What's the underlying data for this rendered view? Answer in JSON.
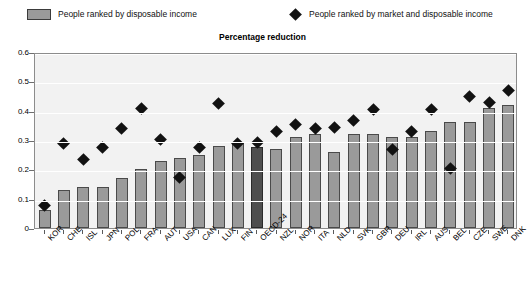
{
  "legend": {
    "items": [
      {
        "label": "People ranked by disposable income",
        "marker": "bar-swatch-icon",
        "color": "#9a9a9a"
      },
      {
        "label": "People ranked by market and disposable income",
        "marker": "diamond-icon",
        "color": "#121212"
      }
    ]
  },
  "title": "Percentage reduction",
  "chart_data": {
    "type": "bar",
    "title": "Percentage reduction",
    "xlabel": "",
    "ylabel": "",
    "ylim": [
      0,
      0.6
    ],
    "yticks": [
      "0",
      "0.1",
      "0.2",
      "0.3",
      "0.4",
      "0.5",
      "0.6"
    ],
    "ytick_values": [
      0,
      0.1,
      0.2,
      0.3,
      0.4,
      0.5,
      0.6
    ],
    "grid": true,
    "legend_position": "top",
    "highlight_category": "OECD-24",
    "highlight_color": "#4e4e4e",
    "bar_color": "#9a9a9a",
    "marker_color": "#121212",
    "categories": [
      "KOR",
      "CHE",
      "ISL",
      "JPN",
      "POL",
      "FRA",
      "AUT",
      "USA",
      "CAN",
      "LUX",
      "FIN",
      "OECD-24",
      "NZL",
      "NOR",
      "ITA",
      "NLD",
      "SVK",
      "GBR",
      "DEU",
      "IRL",
      "AUS",
      "BEL",
      "CZE",
      "SWE",
      "DNK"
    ],
    "series": [
      {
        "name": "People ranked by disposable income",
        "type": "bar",
        "values": [
          0.06,
          0.13,
          0.14,
          0.14,
          0.17,
          0.2,
          0.23,
          0.24,
          0.25,
          0.28,
          0.29,
          0.275,
          0.27,
          0.31,
          0.32,
          0.26,
          0.32,
          0.32,
          0.31,
          0.31,
          0.33,
          0.36,
          0.36,
          0.41,
          0.42
        ]
      },
      {
        "name": "People ranked by market and disposable income",
        "type": "scatter",
        "values": [
          0.085,
          0.295,
          0.24,
          0.28,
          0.345,
          0.415,
          0.31,
          0.18,
          0.28,
          0.43,
          0.295,
          0.3,
          0.335,
          0.36,
          0.345,
          0.35,
          0.375,
          0.41,
          0.275,
          0.335,
          0.41,
          0.21,
          0.455,
          0.435,
          0.475
        ]
      }
    ]
  }
}
